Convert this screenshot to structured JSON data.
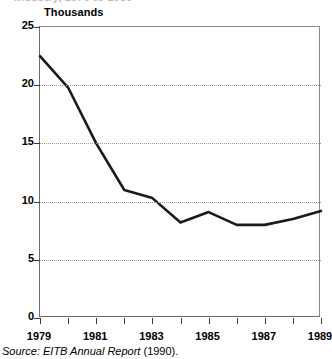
{
  "figure": {
    "cut_caption_remnant": "industry, 1979 to 1989",
    "source_prefix": "Source:",
    "source_italic": "EITB Annual Report",
    "source_suffix": "(1990)."
  },
  "chart_data": {
    "type": "line",
    "title": "",
    "subtitle": "",
    "ylabel": "Thousands",
    "xlabel": "",
    "ylim": [
      0,
      25
    ],
    "xlim": [
      1979,
      1989
    ],
    "grid": true,
    "legend": "none",
    "ytick_labels": [
      "0",
      "5",
      "10",
      "15",
      "20",
      "25"
    ],
    "ytick_values": [
      0,
      5,
      10,
      15,
      20,
      25
    ],
    "xtick_values": [
      1979,
      1980,
      1981,
      1982,
      1983,
      1984,
      1985,
      1986,
      1987,
      1988,
      1989
    ],
    "xtick_labels": [
      "1979",
      "",
      "1981",
      "",
      "1983",
      "",
      "1985",
      "",
      "1987",
      "",
      "1989"
    ],
    "x": [
      1979,
      1980,
      1981,
      1982,
      1983,
      1984,
      1985,
      1986,
      1987,
      1988,
      1989
    ],
    "values": [
      22.5,
      19.8,
      15.0,
      11.0,
      10.3,
      8.2,
      9.1,
      8.0,
      8.0,
      8.5,
      9.2
    ],
    "series": [
      {
        "name": "Employees",
        "color": "#1a1a1a",
        "values": [
          22.5,
          19.8,
          15.0,
          11.0,
          10.3,
          8.2,
          9.1,
          8.0,
          8.0,
          8.5,
          9.2
        ]
      }
    ]
  }
}
